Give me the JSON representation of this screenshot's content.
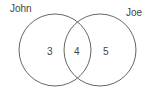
{
  "diagram": {
    "type": "venn",
    "sets": [
      {
        "label": "John",
        "only_count": "3"
      },
      {
        "label": "Joe",
        "only_count": "5"
      }
    ],
    "intersection_count": "4",
    "stroke_color": "#666666"
  }
}
